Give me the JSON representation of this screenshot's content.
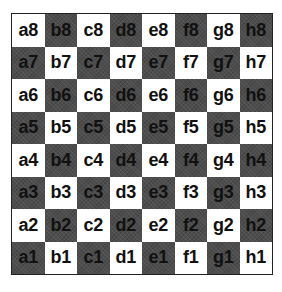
{
  "board": {
    "title": "Chessboard square labels",
    "colors": {
      "light": "#ffffff",
      "dark": "#4d4d4d",
      "text": "#111111"
    },
    "ranks": [
      [
        "a8",
        "b8",
        "c8",
        "d8",
        "e8",
        "f8",
        "g8",
        "h8"
      ],
      [
        "a7",
        "b7",
        "c7",
        "d7",
        "e7",
        "f7",
        "g7",
        "h7"
      ],
      [
        "a6",
        "b6",
        "c6",
        "d6",
        "e6",
        "f6",
        "g6",
        "h6"
      ],
      [
        "a5",
        "b5",
        "c5",
        "d5",
        "e5",
        "f5",
        "g5",
        "h5"
      ],
      [
        "a4",
        "b4",
        "c4",
        "d4",
        "e4",
        "f4",
        "g4",
        "h4"
      ],
      [
        "a3",
        "b3",
        "c3",
        "d3",
        "e3",
        "f3",
        "g3",
        "h3"
      ],
      [
        "a2",
        "b2",
        "c2",
        "d2",
        "e2",
        "f2",
        "g2",
        "h2"
      ],
      [
        "a1",
        "b1",
        "c1",
        "d1",
        "e1",
        "f1",
        "g1",
        "h1"
      ]
    ]
  }
}
